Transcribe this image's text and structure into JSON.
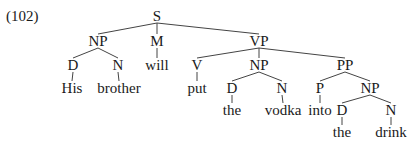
{
  "example_number": "(102)",
  "tree": {
    "nodes": [
      {
        "id": "S",
        "label": "S",
        "x": 157,
        "y": 16
      },
      {
        "id": "NP1",
        "label": "NP",
        "x": 98,
        "y": 41
      },
      {
        "id": "M",
        "label": "M",
        "x": 157,
        "y": 41
      },
      {
        "id": "VP",
        "label": "VP",
        "x": 259,
        "y": 41
      },
      {
        "id": "D1",
        "label": "D",
        "x": 73,
        "y": 65
      },
      {
        "id": "N1",
        "label": "N",
        "x": 118,
        "y": 65
      },
      {
        "id": "will",
        "label": "will",
        "x": 157,
        "y": 65
      },
      {
        "id": "V",
        "label": "V",
        "x": 197,
        "y": 65
      },
      {
        "id": "NP2",
        "label": "NP",
        "x": 259,
        "y": 65
      },
      {
        "id": "PP",
        "label": "PP",
        "x": 345,
        "y": 65
      },
      {
        "id": "His",
        "label": "His",
        "x": 72,
        "y": 88
      },
      {
        "id": "brother",
        "label": "brother",
        "x": 119,
        "y": 88
      },
      {
        "id": "put",
        "label": "put",
        "x": 197,
        "y": 88
      },
      {
        "id": "D2",
        "label": "D",
        "x": 232,
        "y": 88
      },
      {
        "id": "N2",
        "label": "N",
        "x": 282,
        "y": 88
      },
      {
        "id": "P",
        "label": "P",
        "x": 320,
        "y": 88
      },
      {
        "id": "NP3",
        "label": "NP",
        "x": 370,
        "y": 88
      },
      {
        "id": "the1",
        "label": "the",
        "x": 232,
        "y": 110
      },
      {
        "id": "vodka",
        "label": "vodka",
        "x": 283,
        "y": 110
      },
      {
        "id": "into",
        "label": "into",
        "x": 320,
        "y": 110
      },
      {
        "id": "D3",
        "label": "D",
        "x": 342,
        "y": 110
      },
      {
        "id": "N3",
        "label": "N",
        "x": 391,
        "y": 110
      },
      {
        "id": "the2",
        "label": "the",
        "x": 342,
        "y": 132
      },
      {
        "id": "drink",
        "label": "drink",
        "x": 391,
        "y": 132
      }
    ],
    "edges": [
      [
        "S",
        "NP1"
      ],
      [
        "S",
        "M"
      ],
      [
        "S",
        "VP"
      ],
      [
        "NP1",
        "D1"
      ],
      [
        "NP1",
        "N1"
      ],
      [
        "M",
        "will"
      ],
      [
        "VP",
        "V"
      ],
      [
        "VP",
        "NP2"
      ],
      [
        "VP",
        "PP"
      ],
      [
        "D1",
        "His"
      ],
      [
        "N1",
        "brother"
      ],
      [
        "V",
        "put"
      ],
      [
        "NP2",
        "D2"
      ],
      [
        "NP2",
        "N2"
      ],
      [
        "PP",
        "P"
      ],
      [
        "PP",
        "NP3"
      ],
      [
        "D2",
        "the1"
      ],
      [
        "N2",
        "vodka"
      ],
      [
        "P",
        "into"
      ],
      [
        "NP3",
        "D3"
      ],
      [
        "NP3",
        "N3"
      ],
      [
        "D3",
        "the2"
      ],
      [
        "N3",
        "drink"
      ]
    ]
  }
}
